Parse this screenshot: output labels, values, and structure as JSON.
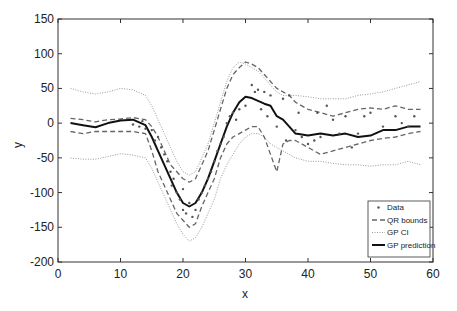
{
  "chart_data": {
    "type": "line",
    "title": "",
    "xlabel": "x",
    "ylabel": "y",
    "xlim": [
      0,
      60
    ],
    "ylim": [
      -200,
      150
    ],
    "xticks": [
      0,
      10,
      20,
      30,
      40,
      50,
      60
    ],
    "yticks": [
      150,
      100,
      50,
      0,
      -50,
      -100,
      -150,
      -200
    ],
    "xtick_labels": [
      "0",
      "10",
      "20",
      "30",
      "40",
      "50",
      "60"
    ],
    "ytick_labels": [
      "150",
      "100",
      "50",
      "0",
      "-50",
      "-100",
      "-150",
      "-200"
    ],
    "grid": false,
    "legend_position": "bottom-right",
    "legend": [
      "Data",
      "QR bounds",
      "GP CI",
      "GP prediction"
    ],
    "x": [
      2,
      4,
      6,
      8,
      10,
      12,
      14,
      15,
      16,
      17,
      18,
      19,
      20,
      21,
      22,
      23,
      24,
      25,
      26,
      27,
      28,
      29,
      30,
      31,
      32,
      33,
      34,
      35,
      36,
      37,
      38,
      40,
      42,
      44,
      46,
      48,
      50,
      52,
      54,
      56,
      58
    ],
    "series": [
      {
        "name": "GP prediction",
        "style": "solid",
        "values": [
          0,
          -3,
          -6,
          0,
          4,
          5,
          -3,
          -20,
          -40,
          -60,
          -80,
          -100,
          -115,
          -120,
          -115,
          -100,
          -80,
          -55,
          -30,
          -5,
          15,
          30,
          38,
          36,
          32,
          28,
          25,
          10,
          5,
          -5,
          -15,
          -18,
          -15,
          -18,
          -15,
          -20,
          -18,
          -10,
          -10,
          -5,
          -5
        ]
      },
      {
        "name": "QR upper",
        "style": "dashed",
        "values": [
          7,
          5,
          2,
          5,
          6,
          8,
          5,
          -5,
          -20,
          -40,
          -60,
          -70,
          -80,
          -85,
          -80,
          -60,
          -40,
          -10,
          20,
          50,
          70,
          80,
          88,
          85,
          80,
          70,
          60,
          50,
          45,
          40,
          30,
          20,
          15,
          10,
          15,
          20,
          22,
          20,
          25,
          20,
          20
        ]
      },
      {
        "name": "QR lower",
        "style": "dashed",
        "values": [
          -12,
          -15,
          -12,
          -12,
          -12,
          -12,
          -15,
          -40,
          -70,
          -90,
          -110,
          -130,
          -140,
          -150,
          -145,
          -120,
          -100,
          -80,
          -50,
          -30,
          -20,
          -15,
          -10,
          -5,
          -5,
          -20,
          -45,
          -70,
          -30,
          -25,
          -25,
          -35,
          -45,
          -40,
          -35,
          -30,
          -25,
          -22,
          -20,
          -15,
          -12
        ]
      },
      {
        "name": "GP CI upper",
        "style": "dotted",
        "values": [
          50,
          45,
          42,
          45,
          50,
          48,
          40,
          25,
          5,
          -15,
          -35,
          -55,
          -70,
          -75,
          -70,
          -50,
          -30,
          0,
          30,
          60,
          80,
          88,
          85,
          80,
          75,
          65,
          55,
          45,
          40,
          40,
          40,
          38,
          35,
          35,
          35,
          40,
          42,
          45,
          50,
          55,
          60
        ]
      },
      {
        "name": "GP CI lower",
        "style": "dotted",
        "values": [
          -50,
          -52,
          -52,
          -48,
          -44,
          -46,
          -50,
          -65,
          -85,
          -105,
          -125,
          -145,
          -160,
          -170,
          -165,
          -150,
          -130,
          -110,
          -80,
          -60,
          -45,
          -30,
          -20,
          -15,
          -15,
          -20,
          -30,
          -35,
          -40,
          -45,
          -50,
          -55,
          -55,
          -58,
          -60,
          -60,
          -62,
          -60,
          -60,
          -55,
          -60
        ]
      }
    ],
    "data_points": [
      [
        12,
        -2
      ],
      [
        13,
        -5
      ],
      [
        13.5,
        3
      ],
      [
        14,
        -8
      ],
      [
        15,
        -10
      ],
      [
        15.5,
        -25
      ],
      [
        16,
        -20
      ],
      [
        16.5,
        -35
      ],
      [
        17,
        -45
      ],
      [
        17.5,
        -55
      ],
      [
        18,
        -70
      ],
      [
        18.2,
        -90
      ],
      [
        18.5,
        -80
      ],
      [
        19,
        -100
      ],
      [
        19.5,
        -110
      ],
      [
        20,
        -95
      ],
      [
        20,
        -125
      ],
      [
        20.5,
        -130
      ],
      [
        21,
        -115
      ],
      [
        21.5,
        -135
      ],
      [
        22,
        -125
      ],
      [
        22.5,
        -110
      ],
      [
        23,
        -100
      ],
      [
        23.5,
        -90
      ],
      [
        24,
        -80
      ],
      [
        24.5,
        -70
      ],
      [
        25,
        -55
      ],
      [
        25.5,
        -40
      ],
      [
        26,
        -30
      ],
      [
        26.5,
        -20
      ],
      [
        27,
        0
      ],
      [
        27.5,
        10
      ],
      [
        28,
        15
      ],
      [
        28.5,
        5
      ],
      [
        29,
        20
      ],
      [
        30,
        25
      ],
      [
        31,
        55
      ],
      [
        31.5,
        45
      ],
      [
        32,
        48
      ],
      [
        32.5,
        20
      ],
      [
        33,
        45
      ],
      [
        33.5,
        10
      ],
      [
        34,
        40
      ],
      [
        35,
        -5
      ],
      [
        36,
        35
      ],
      [
        36.5,
        -25
      ],
      [
        37,
        40
      ],
      [
        38,
        -10
      ],
      [
        38.5,
        15
      ],
      [
        39,
        -20
      ],
      [
        40,
        -30
      ],
      [
        41,
        -25
      ],
      [
        41.5,
        15
      ],
      [
        42,
        -20
      ],
      [
        43,
        25
      ],
      [
        44,
        5
      ],
      [
        45,
        -15
      ],
      [
        46,
        10
      ],
      [
        47,
        -35
      ],
      [
        48,
        -15
      ],
      [
        49,
        10
      ],
      [
        50,
        15
      ],
      [
        52,
        -5
      ],
      [
        54,
        10
      ],
      [
        55,
        0
      ],
      [
        56,
        -5
      ],
      [
        57,
        10
      ]
    ]
  }
}
